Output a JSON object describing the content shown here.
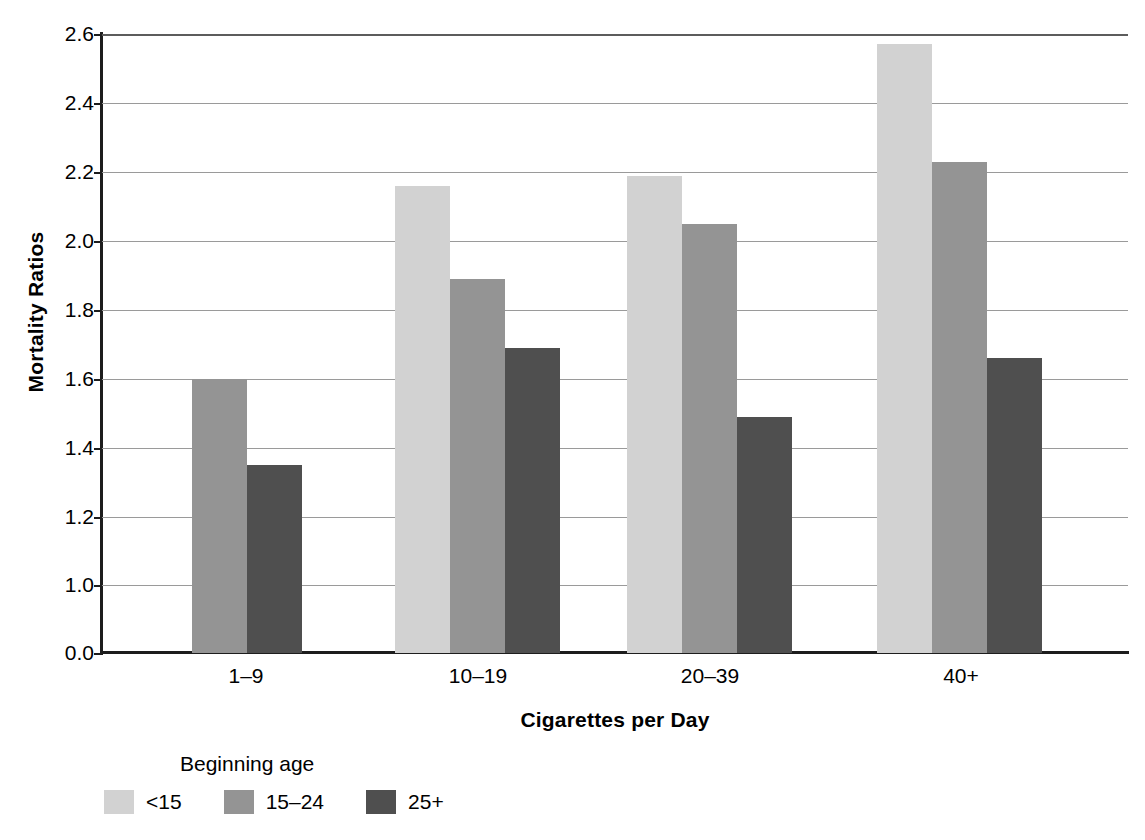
{
  "chart_data": {
    "type": "bar",
    "title": "",
    "xlabel": "Cigarettes per Day",
    "ylabel": "Mortality Ratios",
    "categories": [
      "1–9",
      "10–19",
      "20–39",
      "40+"
    ],
    "series": [
      {
        "name": "<15",
        "color": "#d2d2d2",
        "values": [
          null,
          2.16,
          2.19,
          2.57
        ]
      },
      {
        "name": "15–24",
        "color": "#949494",
        "values": [
          1.6,
          1.89,
          2.05,
          2.23
        ]
      },
      {
        "name": "25+",
        "color": "#4f4f4f",
        "values": [
          1.35,
          1.69,
          1.49,
          1.66
        ]
      }
    ],
    "ylim": [
      0.0,
      2.6
    ],
    "y_ticks": [
      "0.0",
      "1.0",
      "1.2",
      "1.4",
      "1.6",
      "1.8",
      "2.0",
      "2.2",
      "2.4",
      "2.6"
    ],
    "y_axis_note": "broken axis: 0.0 to 1.0 compressed to one step",
    "grid": "horizontal",
    "legend": {
      "title": "Beginning age",
      "position": "below-left",
      "entries": [
        "<15",
        "15–24",
        "25+"
      ]
    }
  },
  "axis": {
    "y_title": "Mortality Ratios",
    "x_title": "Cigarettes per Day",
    "y_ticks": [
      {
        "label": "2.6",
        "y": 34
      },
      {
        "label": "2.4",
        "y": 103
      },
      {
        "label": "2.2",
        "y": 172
      },
      {
        "label": "2.0",
        "y": 241
      },
      {
        "label": "1.8",
        "y": 310
      },
      {
        "label": "1.6",
        "y": 379
      },
      {
        "label": "1.4",
        "y": 448
      },
      {
        "label": "1.2",
        "y": 517
      },
      {
        "label": "1.0",
        "y": 585
      },
      {
        "label": "0.0",
        "y": 653
      }
    ],
    "x_ticks": [
      {
        "label": "1–9",
        "x": 246
      },
      {
        "label": "10–19",
        "x": 478
      },
      {
        "label": "20–39",
        "x": 710
      },
      {
        "label": "40+",
        "x": 961
      }
    ]
  },
  "bars": [
    {
      "group": "1–9",
      "series": "15–24",
      "value": 1.6,
      "class": "medium",
      "left": 90,
      "width": 55,
      "top": 379
    },
    {
      "group": "1–9",
      "series": "25+",
      "value": 1.35,
      "class": "dark",
      "left": 145,
      "width": 55,
      "top": 465
    },
    {
      "group": "10–19",
      "series": "<15",
      "value": 2.16,
      "class": "light",
      "left": 293,
      "width": 55,
      "top": 186
    },
    {
      "group": "10–19",
      "series": "15–24",
      "value": 1.89,
      "class": "medium",
      "left": 348,
      "width": 55,
      "top": 279
    },
    {
      "group": "10–19",
      "series": "25+",
      "value": 1.69,
      "class": "dark",
      "left": 403,
      "width": 55,
      "top": 348
    },
    {
      "group": "20–39",
      "series": "<15",
      "value": 2.19,
      "class": "light",
      "left": 525,
      "width": 55,
      "top": 176
    },
    {
      "group": "20–39",
      "series": "15–24",
      "value": 2.05,
      "class": "medium",
      "left": 580,
      "width": 55,
      "top": 224
    },
    {
      "group": "20–39",
      "series": "25+",
      "value": 1.49,
      "class": "dark",
      "left": 635,
      "width": 55,
      "top": 417
    },
    {
      "group": "40+",
      "series": "<15",
      "value": 2.57,
      "class": "light",
      "left": 775,
      "width": 55,
      "top": 44
    },
    {
      "group": "40+",
      "series": "15–24",
      "value": 2.23,
      "class": "medium",
      "left": 830,
      "width": 55,
      "top": 162
    },
    {
      "group": "40+",
      "series": "25+",
      "value": 1.66,
      "class": "dark",
      "left": 885,
      "width": 55,
      "top": 358
    }
  ],
  "legend": {
    "title": "Beginning age",
    "items": [
      {
        "label": "<15",
        "class": "light"
      },
      {
        "label": "15–24",
        "class": "medium"
      },
      {
        "label": "25+",
        "class": "dark"
      }
    ]
  }
}
